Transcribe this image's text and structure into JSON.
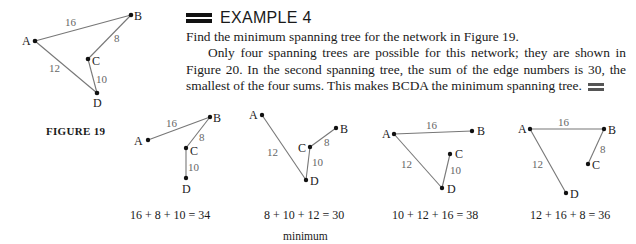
{
  "example": {
    "heading": "EXAMPLE 4",
    "prompt": "Find the minimum spanning tree for the network in Figure 19.",
    "body": "Only four spanning trees are possible for this network; they are shown in Figure 20. In the second spanning tree, the sum of the edge numbers is 30, the smallest of the four sums. This makes BCDA the minimum spanning tree."
  },
  "figure19": {
    "caption": "FIGURE 19",
    "vertices": [
      {
        "id": "A",
        "label": "A"
      },
      {
        "id": "B",
        "label": "B"
      },
      {
        "id": "C",
        "label": "C"
      },
      {
        "id": "D",
        "label": "D"
      }
    ],
    "edges": [
      {
        "from": "A",
        "to": "B",
        "weight": "16"
      },
      {
        "from": "B",
        "to": "C",
        "weight": "8"
      },
      {
        "from": "C",
        "to": "D",
        "weight": "10"
      },
      {
        "from": "A",
        "to": "D",
        "weight": "12"
      }
    ]
  },
  "figure20": {
    "trees": [
      {
        "edges": [
          "AB 16",
          "BC 8",
          "CD 10"
        ],
        "w1": "16",
        "w2": "8",
        "w3": "10",
        "sum": "16 + 8 + 10 = 34",
        "note": ""
      },
      {
        "edges": [
          "BC 8",
          "CD 10",
          "AD 12"
        ],
        "w1": "12",
        "w2": "8",
        "w3": "10",
        "sum": "8 + 10 + 12 = 30",
        "note": "minimum"
      },
      {
        "edges": [
          "CD 10",
          "AD 12",
          "AB 16"
        ],
        "w1": "16",
        "w2": "12",
        "w3": "10",
        "sum": "10 + 12 + 16 = 38",
        "note": ""
      },
      {
        "edges": [
          "AD 12",
          "AB 16",
          "BC 8"
        ],
        "w1": "16",
        "w2": "12",
        "w3": "8",
        "sum": "12 + 16 + 8 = 36",
        "note": ""
      }
    ]
  },
  "labels": {
    "A": "A",
    "B": "B",
    "C": "C",
    "D": "D"
  }
}
